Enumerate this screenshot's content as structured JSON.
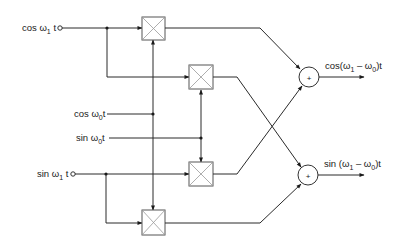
{
  "diagram": {
    "title": "",
    "inputs": {
      "cos_w1": {
        "prefix": "cos ω",
        "sub": "1",
        "suffix": " t"
      },
      "sin_w1": {
        "prefix": "sin ω",
        "sub": "1",
        "suffix": " t"
      },
      "cos_w0": {
        "prefix": "cos ω",
        "sub": "0",
        "suffix": "t"
      },
      "sin_w0": {
        "prefix": "sin ω",
        "sub": "0",
        "suffix": "t"
      }
    },
    "outputs": {
      "upper": {
        "prefix": "cos(ω",
        "sub1": "1",
        "mid": " – ω",
        "sub2": "0",
        "suffix": ")t"
      },
      "lower": {
        "prefix": "sin (ω",
        "sub1": "1",
        "mid": " – ω",
        "sub2": "0",
        "suffix": ")t"
      }
    },
    "summer_symbol": "+",
    "blocks": [
      {
        "id": "mult-1",
        "type": "multiplier",
        "inputs": [
          "cos ω1t",
          "cos ω0t"
        ],
        "to": "upper-summer"
      },
      {
        "id": "mult-2",
        "type": "multiplier",
        "inputs": [
          "cos ω1t",
          "sin ω0t"
        ],
        "to": "lower-summer"
      },
      {
        "id": "mult-3",
        "type": "multiplier",
        "inputs": [
          "sin ω1t",
          "sin ω0t"
        ],
        "to": "upper-summer"
      },
      {
        "id": "mult-4",
        "type": "multiplier",
        "inputs": [
          "sin ω1t",
          "cos ω0t"
        ],
        "to": "lower-summer"
      },
      {
        "id": "upper-summer",
        "type": "adder",
        "output": "cos(ω1 – ω0)t"
      },
      {
        "id": "lower-summer",
        "type": "adder",
        "output": "sin (ω1 – ω0)t"
      }
    ],
    "colors": {
      "line": "#2a2a2a",
      "background": "#ffffff"
    }
  }
}
